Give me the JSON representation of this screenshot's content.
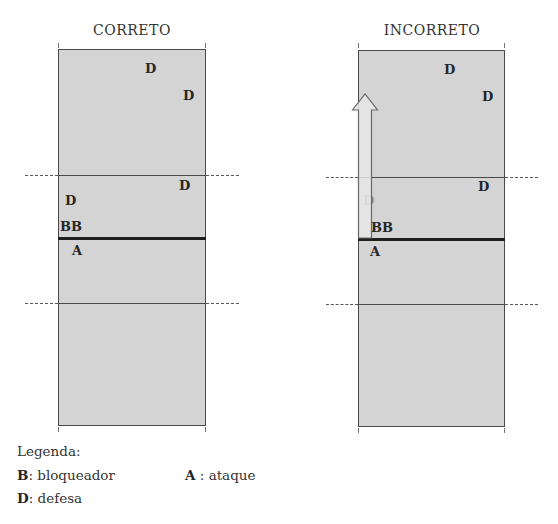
{
  "panels": [
    {
      "title": "CORRETO",
      "players": {
        "back_d1": "D",
        "back_d2": "D",
        "mid_d_right": "D",
        "mid_d_left": "D",
        "blockers": "BB",
        "attacker": "A"
      },
      "arrow": false
    },
    {
      "title": "INCORRETO",
      "players": {
        "back_d1": "D",
        "back_d2": "D",
        "mid_d_right": "D",
        "mid_d_left": "D",
        "blockers": "BB",
        "attacker": "A"
      },
      "arrow": true
    }
  ],
  "legend": {
    "title": "Legenda:",
    "items": [
      {
        "key": "B",
        "separator": ": ",
        "label": "bloqueador"
      },
      {
        "key": "A",
        "separator": " : ",
        "label": "ataque"
      },
      {
        "key": "D",
        "separator": ": ",
        "label": "defesa"
      }
    ]
  },
  "colors": {
    "court_fill": "#d4d4d4",
    "court_border": "#4a4a4a",
    "net": "#1e1e1e",
    "arrow_fill": "#e6e6e6",
    "arrow_stroke": "#6a6a6a",
    "text": "#262626"
  }
}
